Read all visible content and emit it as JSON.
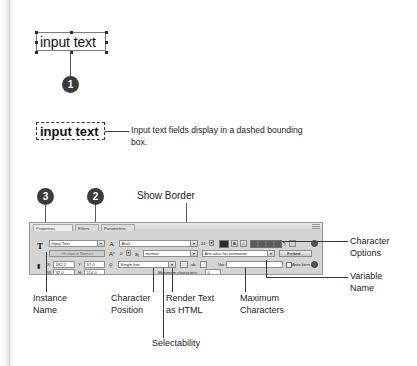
{
  "figure1": {
    "textbox_value": "input text",
    "callout_number": "1"
  },
  "figure2": {
    "textbox_value": "input text",
    "caption": "Input text fields display in a dashed bounding box."
  },
  "figure3": {
    "callouts": [
      {
        "number": "3"
      },
      {
        "number": "2"
      }
    ],
    "top_label": "Show Border",
    "right_labels": [
      {
        "line1": "Character",
        "line2": "Options"
      },
      {
        "line1": "Variable",
        "line2": "Name"
      }
    ],
    "bottom_labels": [
      {
        "line1": "Instance",
        "line2": "Name"
      },
      {
        "line1": "Character",
        "line2": "Position"
      },
      {
        "line1": "Render Text",
        "line2": "as HTML"
      },
      {
        "line1": "Maximum",
        "line2": "Characters"
      }
    ],
    "selectability_label": "Selectability"
  },
  "panel": {
    "tabs": [
      {
        "label": "Properties",
        "active": true
      },
      {
        "label": "Filters",
        "active": false
      },
      {
        "label": "Parameters",
        "active": false
      }
    ],
    "type_glyph": "T",
    "lock_glyph": "▮",
    "text_type": "Input Text",
    "instance_name_placeholder": "<Instance Name>",
    "font_family": "Arial",
    "font_size": "24",
    "font_style": "normal",
    "letter_spacing": "0",
    "anti_alias": "Anti-alias for animation",
    "embed_button": "Embed...",
    "line_type": "Single line",
    "position": {
      "x_label": "X:",
      "x_value": "182.2",
      "y_label": "Y:",
      "y_value": "57.0"
    },
    "size": {
      "w_label": "W:",
      "w_value": "32.0",
      "h_label": "H:",
      "h_value": "114.0"
    },
    "var_label": "Var:",
    "var_value": "",
    "max_chars_label": "Maximum characters:",
    "max_chars_value": "0",
    "auto_kern_label": "Auto kern",
    "bold_label": "B",
    "italic_label": "I",
    "paragraph_label": "¶"
  }
}
